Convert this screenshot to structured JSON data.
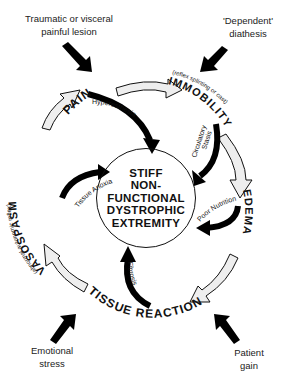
{
  "external_factors": {
    "top_left": "Traumatic or visceral painful lesion",
    "top_left_l1": "Traumatic or visceral",
    "top_left_l2": "painful lesion",
    "top_right_l1": "'Dependent'",
    "top_right_l2": "diathesis",
    "bottom_left_l1": "Emotional",
    "bottom_left_l2": "stress",
    "bottom_right_l1": "Patient",
    "bottom_right_l2": "gain"
  },
  "cycle_nodes": {
    "pain": "PAIN",
    "immobility": "IMMOBILITY",
    "immobility_note": "(reflex splinting or cast)",
    "edema": "EDEMA",
    "tissue_reaction": "TISSUE REACTION",
    "vasospasm": "VASOSPASM",
    "vasospasm_note": "(abnormal autonomic reflex)"
  },
  "inner_links": {
    "pain_link": "Hyperesthesia",
    "immobility_link_l1": "Circulatory",
    "immobility_link_l2": "Stasis",
    "edema_link": "Poor Nutrition",
    "tissue_link": "Fibrosis",
    "vasospasm_link": "Tissue Anoxia"
  },
  "center": {
    "l1": "STIFF",
    "l2": "NON-",
    "l3": "FUNCTIONAL",
    "l4": "DYSTROPHIC",
    "l5": "EXTREMITY"
  }
}
